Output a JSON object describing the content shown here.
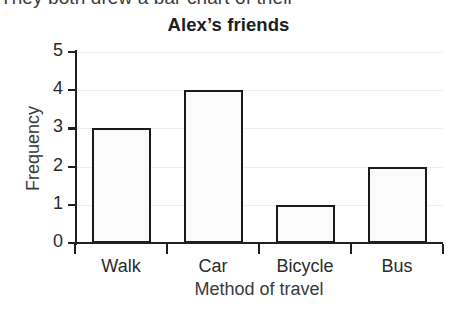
{
  "page": {
    "top_fragment": "They both drew a bar chart of their"
  },
  "chart_data": {
    "type": "bar",
    "title": "Alex’s friends",
    "xlabel": "Method of travel",
    "ylabel": "Frequency",
    "categories": [
      "Walk",
      "Car",
      "Bicycle",
      "Bus"
    ],
    "values": [
      3,
      4,
      1,
      2
    ],
    "ylim": [
      0,
      5
    ],
    "ytick_labels": [
      "0",
      "1",
      "2",
      "3",
      "4",
      "5"
    ],
    "ytick_values": [
      0,
      1,
      2,
      3,
      4,
      5
    ],
    "grid": true,
    "legend": "none",
    "bar_fill_color": "#fbfbfb",
    "bar_edge_color": "#1a1a1c",
    "axis_color": "#231f20",
    "gridline_color": "#ededee",
    "background_color": "#ffffff"
  }
}
